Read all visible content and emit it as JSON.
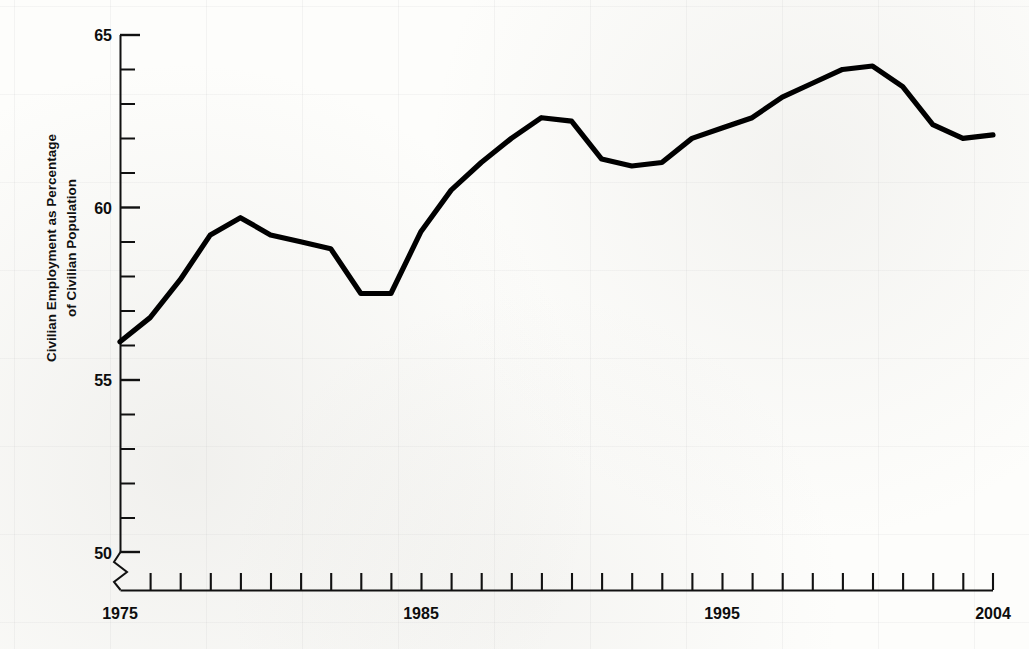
{
  "figure": {
    "background_color": "#fdfdfb",
    "line_color": "#000000",
    "axis_color": "#111111"
  },
  "axes": {
    "y_axis_label_line1": "Civilian Employment as Percentage",
    "y_axis_label_line2": "of Civilian Population",
    "y_tick_labels": [
      "65",
      "60",
      "55",
      "50"
    ],
    "x_tick_labels": [
      "1975",
      "1985",
      "1995",
      "2004"
    ],
    "y_axis_has_break": true,
    "axis_break_symbol": "zigzag"
  },
  "chart_data": {
    "type": "line",
    "title": "",
    "subtitle": "",
    "xlabel": "",
    "ylabel": "Civilian Employment as Percentage of Civilian Population",
    "xlim": [
      1975,
      2004
    ],
    "ylim": [
      50,
      65
    ],
    "ytick_major": [
      50,
      55,
      60,
      65
    ],
    "ytick_minor_step": 1,
    "xtick_step": 1,
    "xtick_labeled": [
      1975,
      1985,
      1995,
      2004
    ],
    "grid": false,
    "legend": "none",
    "axis_break": "y-axis truncated below 50",
    "series": [
      {
        "name": "Civilian Employment as Percentage of Civilian Population",
        "x": [
          1975,
          1976,
          1977,
          1978,
          1979,
          1980,
          1981,
          1982,
          1983,
          1984,
          1985,
          1986,
          1987,
          1988,
          1989,
          1990,
          1991,
          1992,
          1993,
          1994,
          1995,
          1996,
          1997,
          1998,
          1999,
          2000,
          2001,
          2002,
          2003,
          2004
        ],
        "values": [
          56.1,
          56.8,
          57.9,
          59.2,
          59.7,
          59.2,
          59.0,
          58.8,
          57.5,
          57.5,
          59.3,
          60.5,
          61.3,
          62.0,
          62.6,
          62.5,
          61.4,
          61.2,
          61.3,
          62.0,
          62.3,
          62.6,
          63.2,
          63.6,
          64.0,
          64.1,
          63.5,
          62.4,
          62.0,
          62.1
        ]
      }
    ]
  },
  "axis_geometry": {
    "plot_left_px": 120,
    "plot_right_px": 993,
    "y_value_65_px": 35,
    "y_value_50_px": 552
  }
}
